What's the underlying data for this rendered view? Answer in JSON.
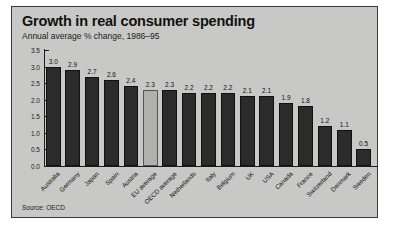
{
  "panel": {
    "title": "Growth in real consumer spending",
    "subtitle": "Annual average % change, 1986–95",
    "source": "Source: OECD",
    "background_color": "#c8c8c6",
    "bar_color": "#2b2b2b",
    "highlight_bar_color": "#b0b0ae"
  },
  "chart_data": {
    "type": "bar",
    "title": "Growth in real consumer spending",
    "subtitle": "Annual average % change, 1986–95",
    "xlabel": "",
    "ylabel": "",
    "ylim": [
      0.0,
      3.5
    ],
    "ytick_labels": [
      "0.0",
      "0.5",
      "1.0",
      "1.5",
      "2.0",
      "2.5",
      "3.0",
      "3.5"
    ],
    "ytick_values": [
      0.0,
      0.5,
      1.0,
      1.5,
      2.0,
      2.5,
      3.0,
      3.5
    ],
    "grid": false,
    "legend": false,
    "categories": [
      "Australia",
      "Germany",
      "Japan",
      "Spain",
      "Austria",
      "EU average",
      "OECD average",
      "Netherlands",
      "Italy",
      "Belgium",
      "UK",
      "USA",
      "Canada",
      "France",
      "Switzerland",
      "Denmark",
      "Sweden"
    ],
    "values": [
      3.0,
      2.9,
      2.7,
      2.6,
      2.4,
      2.3,
      2.3,
      2.2,
      2.2,
      2.2,
      2.1,
      2.1,
      1.9,
      1.8,
      1.2,
      1.1,
      0.5
    ],
    "value_labels": [
      "3.0",
      "2.9",
      "2.7",
      "2.6",
      "2.4",
      "2.3",
      "2.3",
      "2.2",
      "2.2",
      "2.2",
      "2.1",
      "2.1",
      "1.9",
      "1.8",
      "1.2",
      "1.1",
      "0.5"
    ],
    "highlighted": [
      "EU average"
    ],
    "source": "Source: OECD"
  }
}
